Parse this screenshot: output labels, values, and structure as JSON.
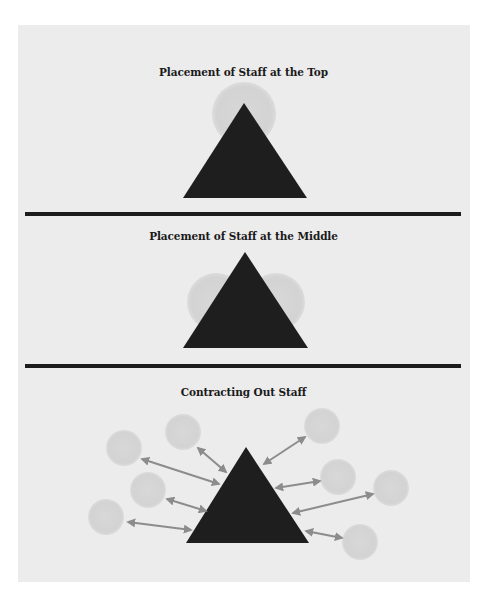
{
  "colors": {
    "background": "#ececec",
    "triangle": "#1e1e1e",
    "circle": "#d5d5d5",
    "arrow": "#8c8c8c",
    "divider": "#1c1c1c"
  },
  "sections": [
    {
      "title": "Placement of Staff at the Top",
      "triangle": {
        "apex": [
          244,
          103
        ],
        "base_left": [
          183,
          198
        ],
        "base_right": [
          307,
          198
        ]
      },
      "circles": [
        {
          "cx": 244,
          "cy": 114,
          "r": 32
        }
      ]
    },
    {
      "title": "Placement of Staff at the Middle",
      "triangle": {
        "apex": [
          245,
          252
        ],
        "base_left": [
          183,
          348
        ],
        "base_right": [
          308,
          348
        ]
      },
      "circles": [
        {
          "cx": 216,
          "cy": 302,
          "r": 29
        },
        {
          "cx": 276,
          "cy": 302,
          "r": 29
        }
      ]
    },
    {
      "title": "Contracting Out Staff",
      "triangle": {
        "apex": [
          246,
          447
        ],
        "base_left": [
          186,
          543
        ],
        "base_right": [
          309,
          543
        ]
      },
      "circles": [
        {
          "cx": 183,
          "cy": 432,
          "r": 18
        },
        {
          "cx": 124,
          "cy": 448,
          "r": 18
        },
        {
          "cx": 148,
          "cy": 490,
          "r": 18
        },
        {
          "cx": 106,
          "cy": 517,
          "r": 18
        },
        {
          "cx": 322,
          "cy": 426,
          "r": 18
        },
        {
          "cx": 338,
          "cy": 477,
          "r": 18
        },
        {
          "cx": 391,
          "cy": 488,
          "r": 18
        },
        {
          "cx": 360,
          "cy": 542,
          "r": 18
        }
      ],
      "arrows": [
        {
          "x1": 198,
          "y1": 448,
          "x2": 226,
          "y2": 472
        },
        {
          "x1": 142,
          "y1": 459,
          "x2": 219,
          "y2": 484
        },
        {
          "x1": 167,
          "y1": 499,
          "x2": 206,
          "y2": 511
        },
        {
          "x1": 128,
          "y1": 522,
          "x2": 191,
          "y2": 530
        },
        {
          "x1": 305,
          "y1": 437,
          "x2": 264,
          "y2": 464
        },
        {
          "x1": 320,
          "y1": 481,
          "x2": 276,
          "y2": 488
        },
        {
          "x1": 373,
          "y1": 494,
          "x2": 293,
          "y2": 513
        },
        {
          "x1": 342,
          "y1": 538,
          "x2": 306,
          "y2": 531
        }
      ]
    }
  ]
}
